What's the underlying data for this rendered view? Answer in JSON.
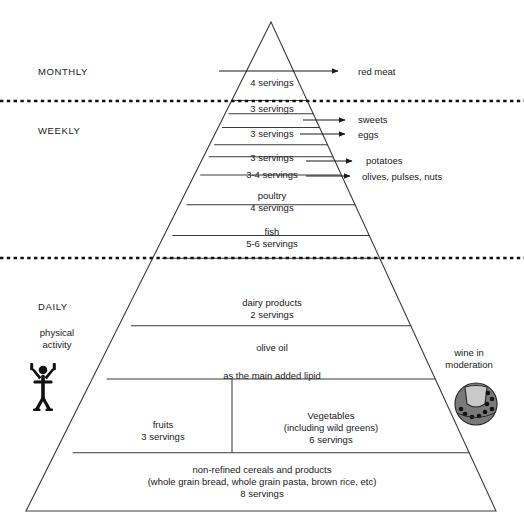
{
  "colors": {
    "stroke": "#3a3a3a",
    "text": "#1a1a1a",
    "background": "#ffffff",
    "icon": "#111111"
  },
  "zone_labels": [
    {
      "id": "monthly",
      "text": "MONTHLY",
      "x": 38,
      "y": 67
    },
    {
      "id": "weekly",
      "text": "WEEKLY",
      "x": 38,
      "y": 126
    },
    {
      "id": "daily",
      "text": "DAILY",
      "x": 38,
      "y": 302
    }
  ],
  "side_labels": [
    {
      "id": "physical-activity",
      "line1": "physical",
      "line2": "activity",
      "x": 52,
      "y": 328
    },
    {
      "id": "wine-in-moderation",
      "line1": "wine in",
      "line2": "moderation",
      "x": 468,
      "y": 348
    }
  ],
  "pyramid_levels": [
    {
      "id": "red-meat",
      "lines": [
        "4 servings"
      ],
      "label_x": 272,
      "label_y": 77
    },
    {
      "id": "sweets",
      "lines": [
        "3 servings"
      ],
      "label_x": 272,
      "label_y": 113
    },
    {
      "id": "eggs",
      "lines": [
        "3 servings"
      ],
      "label_x": 272,
      "label_y": 131
    },
    {
      "id": "potatoes",
      "lines": [
        "3 servings"
      ],
      "label_x": 272,
      "label_y": 156
    },
    {
      "id": "olives-pulses-nuts",
      "lines": [
        "3-4 servings"
      ],
      "label_x": 272,
      "label_y": 175
    },
    {
      "id": "poultry",
      "lines": [
        "poultry",
        "4 servings"
      ],
      "label_x": 272,
      "label_y": 199
    },
    {
      "id": "fish",
      "lines": [
        "fish",
        "5-6 servings"
      ],
      "label_x": 272,
      "label_y": 234
    },
    {
      "id": "dairy-products",
      "lines": [
        "dairy products",
        "2 servings"
      ],
      "label_x": 272,
      "label_y": 297
    },
    {
      "id": "olive-oil",
      "lines": [
        "olive oil"
      ],
      "label_x": 272,
      "label_y": 345
    },
    {
      "id": "olive-oil-lipid",
      "lines": [
        "as the main added lipid"
      ],
      "label_x": 272,
      "label_y": 373
    },
    {
      "id": "fruits",
      "lines": [
        "fruits",
        "3 servings"
      ],
      "label_x": 163,
      "label_y": 420
    },
    {
      "id": "vegetables",
      "lines": [
        "Vegetables",
        "(including wild greens)",
        "6 servings"
      ],
      "label_x": 330,
      "label_y": 414
    },
    {
      "id": "cereals",
      "lines": [
        "non-refined cereals and products",
        "(whole grain bread, whole grain pasta, brown rice, etc)",
        "8 servings"
      ],
      "label_x": 262,
      "label_y": 468
    }
  ],
  "callouts": [
    {
      "id": "red-meat",
      "text": "red meat",
      "text_x": 358,
      "text_y": 66,
      "arrow_x1": 304,
      "arrow_y1": 71,
      "arrow_x2": 344,
      "arrow_y2": 71
    },
    {
      "id": "sweets",
      "text": "sweets",
      "text_x": 360,
      "text_y": 115,
      "arrow_x1": 305,
      "arrow_y1": 120,
      "arrow_x2": 350,
      "arrow_y2": 120
    },
    {
      "id": "eggs",
      "text": "eggs",
      "text_x": 360,
      "text_y": 132,
      "arrow_x1": 303,
      "arrow_y1": 137,
      "arrow_x2": 350,
      "arrow_y2": 137
    },
    {
      "id": "potatoes",
      "text": "potatoes",
      "text_x": 365,
      "text_y": 157,
      "arrow_x1": 308,
      "arrow_y1": 162,
      "arrow_x2": 355,
      "arrow_y2": 162
    },
    {
      "id": "olives-pulses-nuts",
      "text": "olives, pulses, nuts",
      "text_x": 360,
      "text_y": 173,
      "arrow_x1": 308,
      "arrow_y1": 178,
      "arrow_x2": 355,
      "arrow_y2": 178
    }
  ],
  "icons": [
    {
      "id": "physical-activity-icon",
      "name": "exercising-person-icon",
      "x": 28,
      "y": 358,
      "w": 30,
      "h": 48
    },
    {
      "id": "wine-icon",
      "name": "grapes-wine-emblem-icon",
      "x": 455,
      "y": 383,
      "w": 42,
      "h": 42
    }
  ],
  "geometry": {
    "apex_x": 271,
    "apex_y": 22,
    "base_left_x": 26,
    "base_right_x": 496,
    "base_y": 511,
    "divider_y": [
      101.5,
      106,
      124,
      142,
      148,
      166,
      184,
      216,
      258,
      326,
      380,
      455,
      511
    ],
    "dotted_zone_lines": [
      101,
      258
    ],
    "fruit_veg_split_x": 232
  }
}
